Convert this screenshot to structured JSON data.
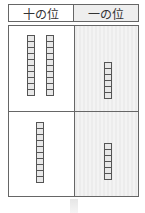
{
  "header": {
    "tens_label": "十の位",
    "ones_label": "一の位"
  },
  "rows": [
    {
      "tens_rods": 2,
      "ones_cubes": 6
    },
    {
      "tens_rods": 1,
      "ones_cubes": 6
    }
  ],
  "colors": {
    "border": "#666666",
    "ones_bg": "#ececec",
    "cube_fill": "#e8e8e8",
    "cube_border": "#555555"
  },
  "arrow": {
    "direction": "down",
    "icon": "down-arrow-icon"
  }
}
